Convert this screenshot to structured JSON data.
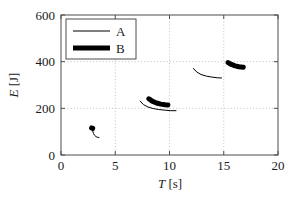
{
  "chart_data": {
    "type": "line",
    "title": "",
    "xlabel": "T [s]",
    "ylabel": "E [J]",
    "xlabel_symbol": "T",
    "xlabel_unit": "[s]",
    "ylabel_symbol": "E",
    "ylabel_unit": "[J]",
    "xlim": [
      0,
      20
    ],
    "ylim": [
      0,
      600
    ],
    "xticks": [
      0,
      5,
      10,
      15,
      20
    ],
    "yticks": [
      0,
      200,
      400,
      600
    ],
    "xtick_labels": [
      "0",
      "5",
      "10",
      "15",
      "20"
    ],
    "ytick_labels": [
      "0",
      "200",
      "400",
      "600"
    ],
    "grid": true,
    "grid_style": "dotted",
    "grid_color": "#b4b4b4",
    "legend_position": "upper left",
    "legend": [
      {
        "name": "A",
        "style": "thin-line",
        "linewidth": 1,
        "color": "#000000"
      },
      {
        "name": "B",
        "style": "thick-line",
        "linewidth": 5,
        "color": "#000000"
      }
    ],
    "series": [
      {
        "name": "A",
        "color": "#000000",
        "linewidth": 1,
        "segments": [
          {
            "cluster": 1,
            "x": [
              2.9,
              3.0,
              3.1,
              3.22,
              3.35,
              3.5
            ],
            "y": [
              106,
              92,
              84,
              79,
              76,
              75
            ]
          },
          {
            "cluster": 2,
            "x": [
              7.3,
              7.6,
              8.0,
              8.5,
              9.0,
              9.6,
              10.1,
              10.6
            ],
            "y": [
              231,
              216,
              206,
              199,
              195,
              192,
              190,
              190
            ]
          },
          {
            "cluster": 3,
            "x": [
              12.2,
              12.5,
              12.9,
              13.4,
              13.9,
              14.4,
              14.8
            ],
            "y": [
              371,
              356,
              345,
              338,
              334,
              331,
              330
            ]
          }
        ]
      },
      {
        "name": "B",
        "color": "#000000",
        "linewidth": 5,
        "segments": [
          {
            "cluster": 1,
            "x": [
              2.82,
              2.92
            ],
            "y": [
              116,
              114
            ]
          },
          {
            "cluster": 2,
            "x": [
              8.1,
              8.4,
              8.8,
              9.2,
              9.6,
              9.85
            ],
            "y": [
              241,
              231,
              223,
              218,
              215,
              214
            ]
          },
          {
            "cluster": 3,
            "x": [
              15.4,
              15.7,
              16.05,
              16.4,
              16.8
            ],
            "y": [
              396,
              388,
              382,
              378,
              376
            ]
          }
        ]
      }
    ]
  }
}
